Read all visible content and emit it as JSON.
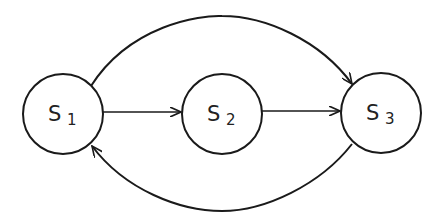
{
  "diagram": {
    "type": "state-transition",
    "colors": {
      "stroke": "#1a1a1a",
      "background": "#ffffff",
      "text": "#222222"
    },
    "nodes": [
      {
        "id": "S1",
        "symbol": "S",
        "subscript": "1",
        "cx": 63,
        "cy": 114,
        "r": 40
      },
      {
        "id": "S2",
        "symbol": "S",
        "subscript": "2",
        "cx": 222,
        "cy": 114,
        "r": 40
      },
      {
        "id": "S3",
        "symbol": "S",
        "subscript": "3",
        "cx": 381,
        "cy": 113,
        "r": 40
      }
    ],
    "edges": [
      {
        "from": "S1",
        "to": "S2",
        "shape": "straight"
      },
      {
        "from": "S2",
        "to": "S3",
        "shape": "straight"
      },
      {
        "from": "S1",
        "to": "S3",
        "shape": "arc-over"
      },
      {
        "from": "S3",
        "to": "S1",
        "shape": "arc-under"
      }
    ]
  }
}
